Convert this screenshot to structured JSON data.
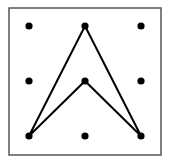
{
  "diagram": {
    "type": "geoboard",
    "border": {
      "x": 9,
      "y": 8,
      "width": 152,
      "height": 147,
      "stroke": "#555555"
    },
    "grid": {
      "columns": [
        29,
        85,
        141
      ],
      "rows": [
        26,
        81,
        136
      ],
      "dot_radius": 3.6,
      "dot_color": "#000000"
    },
    "shape": {
      "name": "concave-arrowhead",
      "points": [
        [
          29,
          136
        ],
        [
          85,
          26
        ],
        [
          141,
          136
        ],
        [
          85,
          81
        ]
      ],
      "stroke": "#000000",
      "stroke_width": 2
    }
  }
}
